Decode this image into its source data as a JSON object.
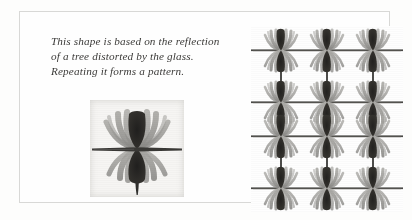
{
  "page": {
    "background_color": "#fdfdfc",
    "plate_border_color": "#d8d8d6"
  },
  "caption": {
    "lines": [
      "This shape is based on the reflection",
      "of a tree distorted by the glass.",
      "Repeating it forms a pattern."
    ],
    "full_text": "This shape is based on the reflection of a tree distorted by the glass. Repeating it forms a pattern.",
    "text_color": "#3b3a38",
    "style": "italic-serif"
  },
  "motif": {
    "name": "tree-reflection-motif",
    "description": "Symmetrical motif: dark vertical bowtie core with grey curved fronds radiating outward, crossed by a horizontal dark band, with a tapering stem below.",
    "tile_background": "#f6f5f3",
    "core_color": "#2b2a28",
    "frond_color": "#8d8c89",
    "frond_light_color": "#b4b3af",
    "band_color": "#3a3936"
  },
  "pattern": {
    "name": "repeating-pattern",
    "columns": 3,
    "rows": 4,
    "description": "Motif repeated in a 3 by 4 grid, units joined by vertical stems and horizontal bands; middle two rows meet as a mirrored pair.",
    "background": "#fefefe",
    "column_x": [
      30,
      76,
      122
    ],
    "row_y": [
      24,
      76,
      110,
      162
    ],
    "band_color": "#4a4946",
    "stem_color": "#2f2e2c"
  },
  "icons": {
    "motif_glyph": "tree-reflection-glyph",
    "pattern_glyph": "repeating-pattern-glyph"
  }
}
